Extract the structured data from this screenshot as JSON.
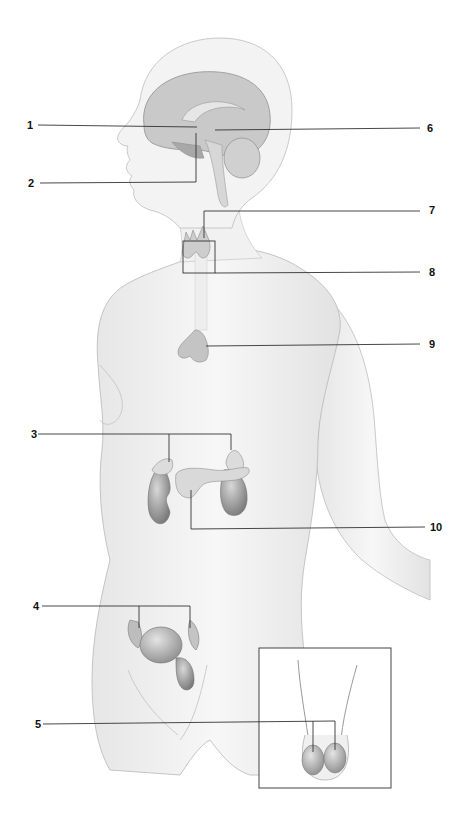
{
  "figure": {
    "colors": {
      "leader_line": "#333333",
      "body_fill": "#f2f2f2",
      "body_outline": "#b5b5b5",
      "organ_fill": "#9a9a9a",
      "organ_dark": "#7d7d7d",
      "gland_fill": "#cfcfcf"
    }
  },
  "labels": [
    {
      "id": "1",
      "text": "1",
      "side": "left",
      "structure": "hypothalamus (leader to brain center)"
    },
    {
      "id": "2",
      "text": "2",
      "side": "left",
      "structure": "pituitary gland"
    },
    {
      "id": "3",
      "text": "3",
      "side": "left",
      "structure": "adrenal glands (two branches)"
    },
    {
      "id": "4",
      "text": "4",
      "side": "left",
      "structure": "ovaries (two branches)"
    },
    {
      "id": "5",
      "text": "5",
      "side": "left",
      "structure": "testes (inset, two branches)"
    },
    {
      "id": "6",
      "text": "6",
      "side": "right",
      "structure": "pineal gland"
    },
    {
      "id": "7",
      "text": "7",
      "side": "right",
      "structure": "thyroid gland"
    },
    {
      "id": "8",
      "text": "8",
      "side": "right",
      "structure": "parathyroid glands (boxed)"
    },
    {
      "id": "9",
      "text": "9",
      "side": "right",
      "structure": "thymus"
    },
    {
      "id": "10",
      "text": "10",
      "side": "right",
      "structure": "pancreas"
    }
  ],
  "inset": {
    "name": "male-reproductive-inset",
    "structure": "testes"
  }
}
